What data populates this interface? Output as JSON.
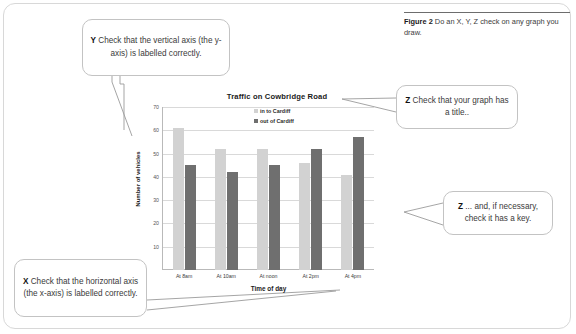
{
  "figure": {
    "label": "Figure 2",
    "caption": " Do an X, Y, Z check on any graph you draw."
  },
  "callouts": {
    "y": {
      "marker": "Y",
      "text": " Check that the vertical axis (the y-axis) is labelled correctly."
    },
    "z_title": {
      "marker": "Z",
      "text": " Check that your graph has a title.."
    },
    "z_key": {
      "marker": "Z",
      "text": " ... and, if necessary, check it has a key."
    },
    "x": {
      "marker": "X",
      "text": " Check that the horizontal axis (the x-axis) is labelled correctly."
    }
  },
  "colors": {
    "series_in": "#d2d2d2",
    "series_out": "#6f6f6f",
    "gridline": "#d9d9d9",
    "axis": "#b9b9b9",
    "frame": "#d8d8d8"
  },
  "chart_data": {
    "type": "bar",
    "title": "Traffic on Cowbridge Road",
    "xlabel": "Time of day",
    "ylabel": "Number of vehicles",
    "categories": [
      "At 8am",
      "At 10am",
      "At noon",
      "At 2pm",
      "At 4pm"
    ],
    "series": [
      {
        "name": "in to Cardiff",
        "values": [
          61,
          52,
          52,
          46,
          41
        ]
      },
      {
        "name": "out of Cardiff",
        "values": [
          45,
          42,
          45,
          52,
          57
        ]
      }
    ],
    "ylim": [
      0,
      70
    ],
    "yticks": [
      70,
      60,
      50,
      40,
      30,
      20,
      10
    ],
    "grid": true,
    "legend_position": "right"
  }
}
